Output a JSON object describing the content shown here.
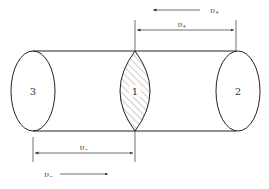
{
  "diagram": {
    "title": "",
    "regions": [
      {
        "id": "region-3",
        "label": "3"
      },
      {
        "id": "region-1",
        "label": "1"
      },
      {
        "id": "region-2",
        "label": "2"
      }
    ],
    "velocities": {
      "top_arrow": {
        "symbol": "υ",
        "subscript": "+",
        "direction": "left"
      },
      "top_dimension": {
        "symbol": "υ",
        "subscript": "+"
      },
      "bottom_dimension": {
        "symbol": "υ",
        "subscript": "−"
      },
      "bottom_arrow": {
        "symbol": "υ",
        "subscript": "−",
        "direction": "right"
      }
    },
    "colors": {
      "line": "#222222",
      "hatch": "#555555",
      "background": "#ffffff"
    }
  }
}
